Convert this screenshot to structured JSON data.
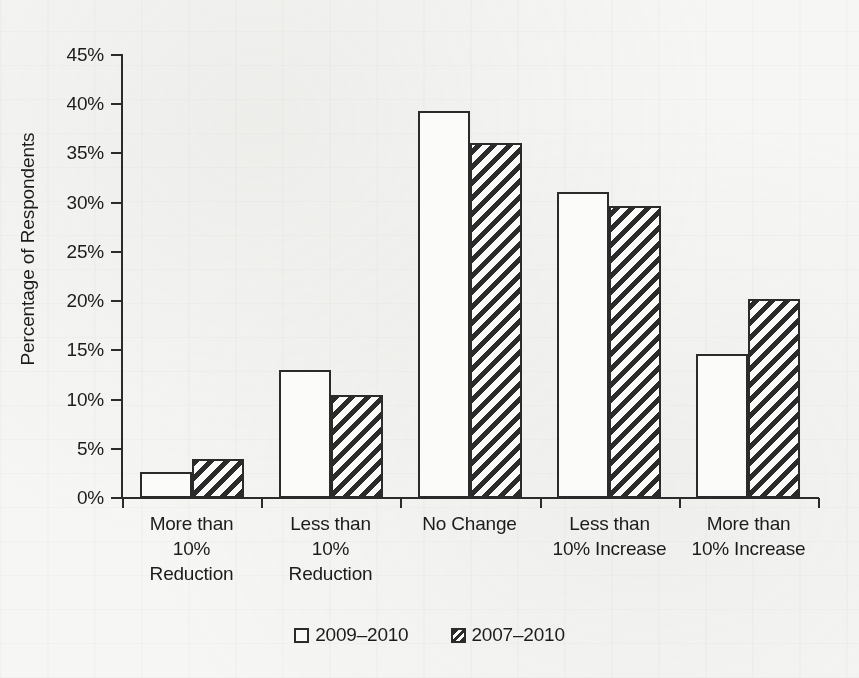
{
  "chart_data": {
    "type": "bar",
    "title": "",
    "xlabel": "",
    "ylabel": "Percentage of Respondents",
    "ylim": [
      0,
      45
    ],
    "y_tick_labels": [
      "45%",
      "40%",
      "35%",
      "30%",
      "25%",
      "20%",
      "15%",
      "10%",
      "5%",
      "0%"
    ],
    "y_tick_values": [
      45,
      40,
      35,
      30,
      25,
      20,
      15,
      10,
      5,
      0
    ],
    "grid": false,
    "legend_position": "bottom-center",
    "categories": [
      "More than\n10%\nReduction",
      "Less than\n10%\nReduction",
      "No Change",
      "Less than\n10% Increase",
      "More than\n10% Increase"
    ],
    "category_lines": [
      [
        "More than",
        "10%",
        "Reduction"
      ],
      [
        "Less than",
        "10%",
        "Reduction"
      ],
      [
        "No Change",
        "",
        ""
      ],
      [
        "Less than",
        "10% Increase",
        ""
      ],
      [
        "More than",
        "10% Increase",
        ""
      ]
    ],
    "series": [
      {
        "name": "2009–2010",
        "pattern": "open",
        "values": [
          2.6,
          13.0,
          39.3,
          31.1,
          14.6
        ]
      },
      {
        "name": "2007–2010",
        "pattern": "diagonal-hatch",
        "values": [
          4.0,
          10.5,
          36.1,
          29.7,
          20.2
        ]
      }
    ]
  },
  "colors": {
    "background": "#f6f6f4",
    "ink": "#2b2b2b",
    "bar_face": "#fbfbf9"
  },
  "axis": {
    "y_title": "Percentage of Respondents"
  },
  "legend": {
    "entries": [
      {
        "label": "2009–2010",
        "pattern": "open"
      },
      {
        "label": "2007–2010",
        "pattern": "diagonal-hatch"
      }
    ]
  }
}
